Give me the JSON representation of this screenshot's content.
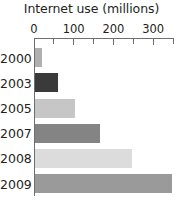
{
  "chart_data": {
    "type": "bar",
    "orientation": "horizontal",
    "title": "Internet use (millions)",
    "xlabel": "",
    "ylabel": "",
    "categories": [
      "2000",
      "2003",
      "2005",
      "2007",
      "2008",
      "2009"
    ],
    "values": [
      20,
      60,
      103,
      165,
      248,
      348
    ],
    "xlim": [
      0,
      350
    ],
    "xticks": [
      0,
      50,
      100,
      150,
      200,
      250,
      300,
      350
    ],
    "xtick_labels": [
      "0",
      "",
      "100",
      "",
      "200",
      "",
      "300",
      ""
    ],
    "labeled_ticks": [
      {
        "value": 0,
        "label": "0"
      },
      {
        "value": 100,
        "label": "100"
      },
      {
        "value": 200,
        "label": "200"
      },
      {
        "value": 300,
        "label": "300"
      }
    ],
    "grid": false,
    "legend": false,
    "axis_color": "#6d6e70",
    "text_color": "#231f20",
    "background": "#ffffff",
    "bars": [
      {
        "category": "2000",
        "value": 20,
        "color": "#b0b0b0"
      },
      {
        "category": "2003",
        "value": 60,
        "color": "#3a3a3a"
      },
      {
        "category": "2005",
        "value": 103,
        "color": "#c6c6c6"
      },
      {
        "category": "2007",
        "value": 165,
        "color": "#848484"
      },
      {
        "category": "2008",
        "value": 248,
        "color": "#dcdcdc"
      },
      {
        "category": "2009",
        "value": 348,
        "color": "#9a9a9a"
      }
    ]
  }
}
